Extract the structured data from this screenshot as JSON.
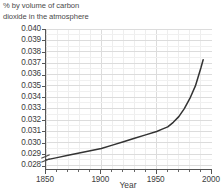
{
  "chart_data": {
    "type": "line",
    "title": "% by volume of carbon\ndioxide in the atmosphere",
    "xlabel": "Year",
    "ylabel": "",
    "xlim": [
      1850,
      2000
    ],
    "ylim": [
      0.0275,
      0.04
    ],
    "grid": true,
    "legend": "none",
    "axis_break": {
      "axis": "y",
      "below": 0.028,
      "symbol": "double-slash"
    },
    "xticks": [
      1850,
      1900,
      1950,
      2000
    ],
    "xtick_labels": [
      "1850",
      "1900",
      "1950",
      "2000"
    ],
    "xminor_step": 10,
    "yticks": [
      0.028,
      0.029,
      0.03,
      0.031,
      0.032,
      0.033,
      0.034,
      0.035,
      0.036,
      0.037,
      0.038,
      0.039,
      0.04
    ],
    "ytick_labels": [
      "0.028",
      "0.029",
      "0.030",
      "0.031",
      "0.032",
      "0.033",
      "0.034",
      "0.035",
      "0.036",
      "0.037",
      "0.038",
      "0.039",
      "0.040"
    ],
    "series": [
      {
        "name": "Carbon dioxide",
        "color": "#333333",
        "x": [
          1850,
          1860,
          1870,
          1880,
          1890,
          1900,
          1910,
          1920,
          1930,
          1940,
          1950,
          1955,
          1960,
          1965,
          1970,
          1975,
          1980,
          1985,
          1990,
          1992
        ],
        "values": [
          0.0285,
          0.0287,
          0.0289,
          0.0291,
          0.0293,
          0.0295,
          0.0298,
          0.0301,
          0.0304,
          0.0307,
          0.031,
          0.0312,
          0.0314,
          0.0318,
          0.0323,
          0.033,
          0.0339,
          0.035,
          0.0366,
          0.0373
        ]
      }
    ]
  },
  "axis": {
    "x_title": "Year"
  },
  "break_marker": {
    "name": "y-axis-break"
  }
}
